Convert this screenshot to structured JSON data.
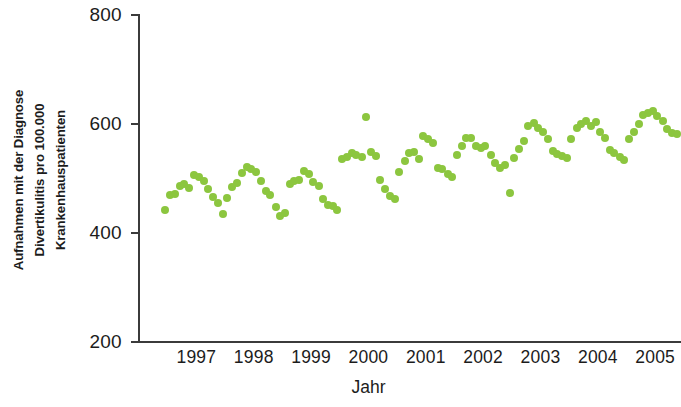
{
  "chart_data": {
    "type": "scatter",
    "title": "",
    "xlabel": "Jahr",
    "ylabel": "Aufnahmen mit der Diagnose Divertikulitis pro 100.000 Krankenhauspatienten",
    "ylabel_lines": [
      "Aufnahmen mit der Diagnose",
      "Divertikulitis pro 100.000",
      "Krankenhauspatienten"
    ],
    "ylim": [
      200,
      800
    ],
    "yticks": [
      200,
      400,
      600,
      800
    ],
    "ytick_labels": [
      "200",
      "400",
      "600",
      "800"
    ],
    "xlim": [
      1996.5,
      2005.95
    ],
    "xticks": [
      1997,
      1998,
      1999,
      2000,
      2001,
      2002,
      2003,
      2004,
      2005
    ],
    "xtick_labels": [
      "1997",
      "1998",
      "1999",
      "2000",
      "2001",
      "2002",
      "2003",
      "2004",
      "2005"
    ],
    "grid": false,
    "legend": null,
    "marker_color": "#8cc63f",
    "marker_size": 8,
    "point_count": 108,
    "series": [
      {
        "name": "Aufnahmen pro 100.000 Krankenhauspatienten",
        "color": "#8cc63f",
        "x": [
          1996.96,
          1997.04,
          1997.13,
          1997.21,
          1997.29,
          1997.38,
          1997.46,
          1997.54,
          1997.63,
          1997.71,
          1997.79,
          1997.88,
          1997.96,
          1998.04,
          1998.13,
          1998.21,
          1998.29,
          1998.38,
          1998.46,
          1998.54,
          1998.63,
          1998.71,
          1998.79,
          1998.88,
          1998.96,
          1999.04,
          1999.13,
          1999.21,
          1999.29,
          1999.38,
          1999.46,
          1999.54,
          1999.63,
          1999.71,
          1999.79,
          1999.88,
          1999.96,
          2000.04,
          2000.13,
          2000.21,
          2000.29,
          2000.38,
          2000.46,
          2000.54,
          2000.63,
          2000.71,
          2000.79,
          2000.88,
          2000.96,
          2001.04,
          2001.13,
          2001.21,
          2001.29,
          2001.38,
          2001.46,
          2001.54,
          2001.63,
          2001.71,
          2001.79,
          2001.88,
          2001.96,
          2002.04,
          2002.13,
          2002.21,
          2002.29,
          2002.38,
          2002.46,
          2002.54,
          2002.63,
          2002.71,
          2002.79,
          2002.88,
          2002.96,
          2003.04,
          2003.13,
          2003.21,
          2003.29,
          2003.38,
          2003.46,
          2003.54,
          2003.63,
          2003.71,
          2003.79,
          2003.88,
          2003.96,
          2004.04,
          2004.13,
          2004.21,
          2004.29,
          2004.38,
          2004.46,
          2004.54,
          2004.63,
          2004.71,
          2004.79,
          2004.88,
          2004.96,
          2005.04,
          2005.13,
          2005.21,
          2005.29,
          2005.38,
          2005.46,
          2005.54,
          2005.63,
          2005.71,
          2005.79,
          2005.88
        ],
        "y": [
          443,
          470,
          472,
          487,
          489,
          483,
          506,
          503,
          496,
          481,
          466,
          455,
          434,
          465,
          485,
          491,
          510,
          522,
          518,
          512,
          495,
          477,
          470,
          447,
          432,
          437,
          489,
          495,
          498,
          513,
          509,
          493,
          486,
          462,
          452,
          450,
          443,
          536,
          539,
          546,
          543,
          540,
          613,
          549,
          541,
          497,
          481,
          467,
          462,
          512,
          533,
          547,
          549,
          536,
          578,
          573,
          565,
          520,
          517,
          508,
          503,
          544,
          560,
          574,
          575,
          560,
          556,
          560,
          544,
          529,
          520,
          524,
          473,
          537,
          555,
          568,
          597,
          601,
          593,
          585,
          572,
          551,
          545,
          541,
          537,
          573,
          592,
          600,
          606,
          596,
          604,
          585,
          574,
          552,
          546,
          540,
          534,
          572,
          586,
          600,
          616,
          620,
          624,
          614,
          605,
          590,
          584,
          581
        ]
      }
    ]
  },
  "axis": {
    "y_title_font_weight": "bold",
    "x_title": "Jahr"
  }
}
